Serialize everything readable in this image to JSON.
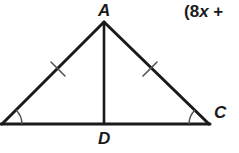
{
  "figure": {
    "name": "isosceles-triangle-with-altitude",
    "background_color": "#ffffff",
    "width": 239,
    "height": 153,
    "stroke_color": "#1a1a1a",
    "arc_color": "#555555",
    "tick_color": "#555555"
  },
  "labels": {
    "apex": "A",
    "right_vertex": "C",
    "foot": "D"
  },
  "annotation": {
    "expression_open_paren": "(8",
    "expression_variable": "x",
    "expression_operator": " +"
  },
  "geometry": {
    "points": {
      "A": {
        "x": 104,
        "y": 22
      },
      "B": {
        "x": 2,
        "y": 124
      },
      "C": {
        "x": 209,
        "y": 124
      },
      "D": {
        "x": 104,
        "y": 124
      }
    },
    "segments": [
      {
        "name": "side-AB",
        "from": "A",
        "to": "B"
      },
      {
        "name": "side-AC",
        "from": "A",
        "to": "C"
      },
      {
        "name": "base-BC",
        "from": "B",
        "to": "C"
      },
      {
        "name": "altitude-AD",
        "from": "A",
        "to": "D"
      }
    ],
    "congruence_ticks": [
      {
        "name": "tick-mark-left-leg",
        "x": 58,
        "y": 69
      },
      {
        "name": "tick-mark-right-leg",
        "x": 150,
        "y": 69
      }
    ],
    "angle_arcs": [
      {
        "name": "angle-arc-left-vertex",
        "vertex": "B",
        "radius": 20
      },
      {
        "name": "angle-arc-right-vertex",
        "vertex": "C",
        "radius": 20
      }
    ]
  }
}
